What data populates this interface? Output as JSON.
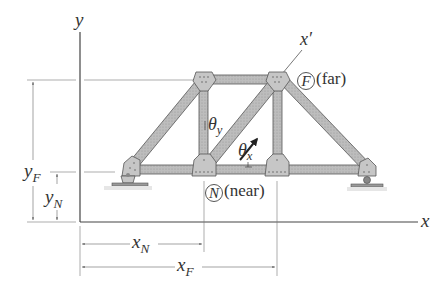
{
  "diagram": {
    "type": "truss-coordinate-definition",
    "colors": {
      "axis": "#444444",
      "dimension_line": "#666666",
      "member_fill": "#b8b8b8",
      "member_stroke": "#555555",
      "gusset_fill": "#c4c4c4",
      "label": "#333333"
    },
    "axes": {
      "x_label": "x",
      "y_label": "y",
      "local_x_label": "x′"
    },
    "points": {
      "far": {
        "symbol": "F",
        "text": "(far)"
      },
      "near": {
        "symbol": "N",
        "text": "(near)"
      }
    },
    "angles": {
      "theta_y": {
        "symbol": "θ",
        "sub": "y"
      },
      "theta_x": {
        "symbol": "θ",
        "sub": "x"
      }
    },
    "dimensions": {
      "y_F": {
        "symbol": "y",
        "sub": "F"
      },
      "y_N": {
        "symbol": "y",
        "sub": "N"
      },
      "x_N": {
        "symbol": "x",
        "sub": "N"
      },
      "x_F": {
        "symbol": "x",
        "sub": "F"
      }
    },
    "truss": {
      "top_nodes": 2,
      "bottom_nodes": 4,
      "supports": [
        "pin",
        "roller"
      ]
    }
  }
}
